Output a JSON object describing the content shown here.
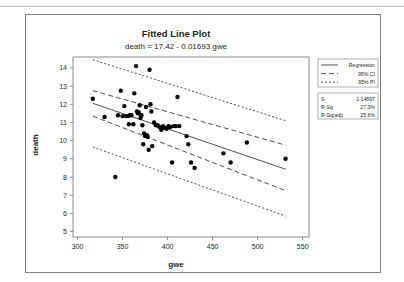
{
  "window": {
    "panel_name": "fitted-line-plot-panel"
  },
  "chart_data": {
    "type": "scatter",
    "title": "Fitted Line Plot",
    "subtitle": "death =  17.42 - 0.01693 gwe",
    "xlabel": "gwe",
    "ylabel": "death",
    "xlim": [
      295,
      557
    ],
    "ylim": [
      4.7,
      14.6
    ],
    "xticks": [
      300,
      350,
      400,
      450,
      500,
      550
    ],
    "yticks": [
      5,
      6,
      7,
      8,
      9,
      10,
      11,
      12,
      13,
      14
    ],
    "grid": false,
    "legend_position": "right",
    "legend": [
      {
        "label": "Regression",
        "style": "solid"
      },
      {
        "label": "95% CI",
        "style": "dashed"
      },
      {
        "label": "95% PI",
        "style": "dotted"
      }
    ],
    "stats": [
      {
        "label": "S",
        "value": "1.14897"
      },
      {
        "label": "R-Sq",
        "value": "27.3%"
      },
      {
        "label": "R-Sq(adj)",
        "value": "25.6%"
      }
    ],
    "fit": {
      "intercept": 17.42,
      "slope": -0.01693,
      "s": 1.14897,
      "r_sq": 27.3,
      "r_sq_adj": 25.6
    },
    "series": [
      {
        "name": "death vs gwe",
        "x": [
          317,
          330,
          342,
          345,
          348,
          350,
          352,
          354,
          356,
          357,
          358,
          360,
          362,
          363,
          365,
          366,
          367,
          368,
          369,
          370,
          371,
          372,
          373,
          374,
          375,
          376,
          377,
          378,
          379,
          380,
          381,
          382,
          383,
          385,
          387,
          389,
          391,
          393,
          395,
          397,
          399,
          401,
          403,
          405,
          407,
          409,
          411,
          413,
          421,
          423,
          426,
          430,
          462,
          470,
          488,
          531
        ],
        "y": [
          12.3,
          11.3,
          8.0,
          11.4,
          12.75,
          11.35,
          11.9,
          11.35,
          11.35,
          10.9,
          11.4,
          11.4,
          10.9,
          12.6,
          14.1,
          11.6,
          11.5,
          11.55,
          11.95,
          11.25,
          11.4,
          10.85,
          9.8,
          10.4,
          10.25,
          11.85,
          10.3,
          10.2,
          9.5,
          13.9,
          12.0,
          11.6,
          9.7,
          11.0,
          10.85,
          10.85,
          10.75,
          10.6,
          10.8,
          10.7,
          10.65,
          10.8,
          10.75,
          8.8,
          10.8,
          10.8,
          12.4,
          10.8,
          10.25,
          9.8,
          8.8,
          8.5,
          9.3,
          8.8,
          9.9,
          9.0
        ]
      }
    ],
    "ci_upper": {
      "x": [
        317,
        531
      ],
      "y": [
        12.75,
        9.75
      ]
    },
    "ci_lower": {
      "x": [
        317,
        531
      ],
      "y": [
        11.35,
        7.25
      ]
    },
    "pi_upper": {
      "x": [
        317,
        531
      ],
      "y": [
        14.45,
        11.1
      ]
    },
    "pi_lower": {
      "x": [
        317,
        531
      ],
      "y": [
        9.65,
        5.85
      ]
    }
  }
}
